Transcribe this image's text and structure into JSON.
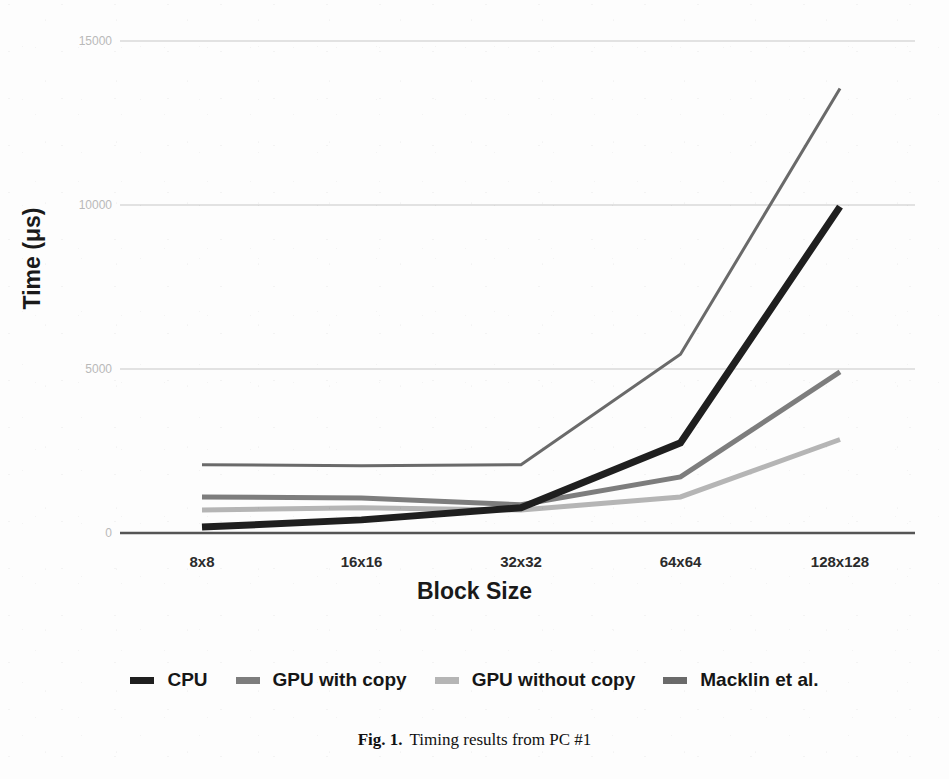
{
  "figure": {
    "caption_label": "Fig. 1.",
    "caption_text": "Timing results from PC #1"
  },
  "axes": {
    "y_title": "Time (μs)",
    "x_title": "Block Size"
  },
  "colors": {
    "cpu": "#1f1f1f",
    "gpu_with_copy": "#7d7d7d",
    "gpu_without_copy": "#b5b5b5",
    "macklin": "#6a6a6a",
    "gridline": "#d8d8d8",
    "baseline": "#555555",
    "tick_label": "#b9b9b9",
    "axis_text": "#1a1a1a",
    "background": "#fdfdfd"
  },
  "chart_data": {
    "type": "line",
    "title": "Timing results from PC #1",
    "xlabel": "Block Size",
    "ylabel": "Time (μs)",
    "categories": [
      "8x8",
      "16x16",
      "32x32",
      "64x64",
      "128x128"
    ],
    "ylim": [
      0,
      15000
    ],
    "yticks": [
      0,
      5000,
      10000,
      15000
    ],
    "ytick_labels": [
      "0",
      "5000",
      "10000",
      "15000"
    ],
    "grid": true,
    "legend_position": "bottom",
    "series": [
      {
        "name": "CPU",
        "color": "#1f1f1f",
        "width": 7,
        "values": [
          180,
          400,
          770,
          2750,
          9950
        ]
      },
      {
        "name": "GPU with copy",
        "color": "#7d7d7d",
        "width": 5,
        "values": [
          1100,
          1070,
          860,
          1710,
          4910
        ]
      },
      {
        "name": "GPU without copy",
        "color": "#b5b5b5",
        "width": 5,
        "values": [
          700,
          770,
          700,
          1100,
          2850
        ]
      },
      {
        "name": "Macklin et al.",
        "color": "#6a6a6a",
        "width": 3,
        "values": [
          2080,
          2050,
          2080,
          5450,
          13550
        ]
      }
    ]
  },
  "legend": {
    "items": [
      {
        "label": "CPU",
        "color": "#1f1f1f"
      },
      {
        "label": "GPU with copy",
        "color": "#7d7d7d"
      },
      {
        "label": "GPU without copy",
        "color": "#b5b5b5"
      },
      {
        "label": "Macklin et al.",
        "color": "#6a6a6a"
      }
    ]
  }
}
